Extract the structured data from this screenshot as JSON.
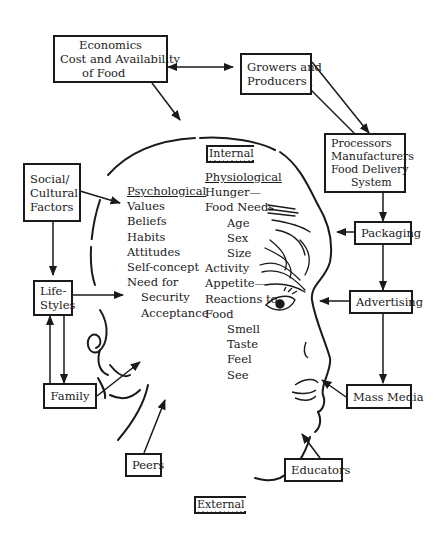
{
  "legend": {
    "internal": "Internal",
    "external": "External"
  },
  "boxes": {
    "economics": {
      "lines": [
        "Economics",
        "Cost and Availability",
        "of Food"
      ]
    },
    "growers": {
      "lines": [
        "Growers and",
        "Producers"
      ]
    },
    "processors": {
      "lines": [
        "Processors",
        "Manufacturers",
        "Food Delivery",
        "System"
      ]
    },
    "packaging": {
      "lines": [
        "Packaging"
      ]
    },
    "advertising": {
      "lines": [
        "Advertising"
      ]
    },
    "mass_media": {
      "lines": [
        "Mass Media"
      ]
    },
    "educators": {
      "lines": [
        "Educators"
      ]
    },
    "peers": {
      "lines": [
        "Peers"
      ]
    },
    "family": {
      "lines": [
        "Family"
      ]
    },
    "lifestyles": {
      "lines": [
        "Life-",
        "Styles"
      ]
    },
    "social": {
      "lines": [
        "Social/",
        "Cultural",
        "Factors"
      ]
    }
  },
  "psychological": {
    "heading": "Psychological",
    "items": [
      "Values",
      "Beliefs",
      "Habits",
      "Attitudes",
      "Self-concept",
      "Need for"
    ],
    "sub_items": [
      "Security",
      "Acceptance"
    ]
  },
  "physiological": {
    "heading": "Physiological",
    "line1": "Hunger—",
    "line2": "Food Needs",
    "needs": [
      "Age",
      "Sex",
      "Size"
    ],
    "line3": "Activity",
    "line4": "Appetite—",
    "line5": "Reactions to",
    "line6": "Food",
    "senses": [
      "Smell",
      "Taste",
      "Feel",
      "See"
    ]
  },
  "colors": {
    "ink": "#1a1a1a",
    "background": "#ffffff",
    "hatch": "#9a9a9a"
  }
}
